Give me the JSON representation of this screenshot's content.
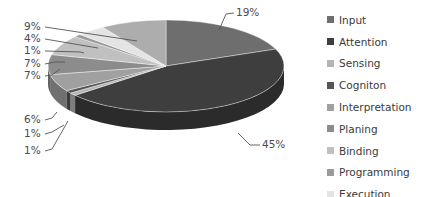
{
  "chart_data": {
    "type": "pie",
    "style": "3d",
    "title": "",
    "categories": [
      "Input",
      "Attention",
      "Sensing",
      "Cogniton",
      "Interpretation",
      "Planing",
      "Binding",
      "Programming",
      "Execution",
      "Action"
    ],
    "values": [
      19,
      45,
      1,
      1,
      6,
      7,
      7,
      1,
      4,
      9
    ],
    "data_labels": [
      "19%",
      "45%",
      "1%",
      "1%",
      "6%",
      "7%",
      "7%",
      "1%",
      "4%",
      "9%"
    ],
    "colors": [
      "#6e6e6e",
      "#3e3e3e",
      "#b4b4b4",
      "#555555",
      "#a0a0a0",
      "#8c8c8c",
      "#c0c0c0",
      "#9a9a9a",
      "#e4e4e4",
      "#adadad"
    ],
    "start_angle": "12 o'clock",
    "direction": "clockwise",
    "legend_position": "right"
  },
  "legend": {
    "items": [
      {
        "label": "Input",
        "color": "#6e6e6e"
      },
      {
        "label": "Attention",
        "color": "#3e3e3e"
      },
      {
        "label": "Sensing",
        "color": "#b4b4b4"
      },
      {
        "label": "Cogniton",
        "color": "#555555"
      },
      {
        "label": "Interpretation",
        "color": "#a0a0a0"
      },
      {
        "label": "Planing",
        "color": "#8c8c8c"
      },
      {
        "label": "Binding",
        "color": "#c0c0c0"
      },
      {
        "label": "Programming",
        "color": "#9a9a9a"
      },
      {
        "label": "Execution",
        "color": "#e4e4e4"
      },
      {
        "label": "Action",
        "color": "#adadad"
      }
    ]
  }
}
